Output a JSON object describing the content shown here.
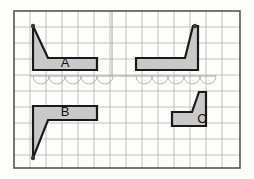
{
  "figure": {
    "background_color": "#fdfdfc",
    "frame": {
      "x": 14,
      "y": 11,
      "width": 226,
      "height": 157,
      "stroke_color": "#555555",
      "stroke_width": 1.6
    },
    "grid": {
      "visible": true,
      "cell_size": 16,
      "line_color": "#b9b9b9",
      "line_width": 0.9,
      "columns": 14,
      "rows": 10
    },
    "shape_style": {
      "fill_color": "#c9c9c9",
      "stroke_color": "#1a1a1a",
      "stroke_width": 2.2,
      "vertex_dot_color": "#3a3a3a",
      "vertex_dot_radius": 2.2
    },
    "guide_line": {
      "visible": true,
      "color": "#9a9a9a",
      "width": 0.9,
      "vertical_x": 112,
      "vertical_y1": 11,
      "vertical_y2": 76,
      "baseline_y": 76,
      "baseline_x1": 30,
      "baseline_x2": 216
    },
    "scallops": {
      "visible": true,
      "color": "#b0b0b0",
      "width": 0.9,
      "baseline_y": 76,
      "radius": 8,
      "groups": [
        {
          "start_x": 33,
          "count": 5
        },
        {
          "start_x": 136,
          "count": 5
        }
      ]
    },
    "shapes": [
      {
        "id": "shape-a",
        "label": "A",
        "label_x": 65,
        "label_y": 64,
        "points": "33,26 48,58 97,58 97,70 33,70",
        "vertex_dots": [
          [
            33,
            26
          ]
        ]
      },
      {
        "id": "shape-unlabeled-top-right",
        "label": "",
        "label_x": 0,
        "label_y": 0,
        "points": "136,58 185,58 193,26 198,26 198,70 136,70",
        "vertex_dots": [
          [
            195,
            26
          ]
        ]
      },
      {
        "id": "shape-b",
        "label": "B",
        "label_x": 65,
        "label_y": 113,
        "points": "33,106 97,106 97,120 48,120 33,158",
        "vertex_dots": [
          [
            33,
            158
          ]
        ]
      },
      {
        "id": "shape-c",
        "label": "C",
        "label_x": 202,
        "label_y": 120,
        "points": "172,112 192,112 199,92 206,92 206,126 172,126",
        "vertex_dots": []
      }
    ]
  }
}
